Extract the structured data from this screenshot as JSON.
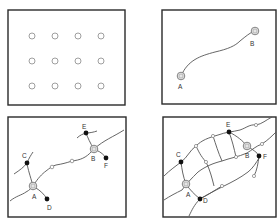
{
  "panels": [
    {
      "id": "grid-of-points",
      "description": "4x3 grid of hollow circles",
      "labels": []
    },
    {
      "id": "single-link",
      "description": "Curve connecting two hubs",
      "labels": {
        "a": "A",
        "b": "B"
      }
    },
    {
      "id": "hubs-with-spurs",
      "description": "Main route A-B with branches to C, D, E, F",
      "labels": {
        "a": "A",
        "b": "B",
        "c": "C",
        "d": "D",
        "e": "E",
        "f": "F"
      }
    },
    {
      "id": "full-network",
      "description": "Dense network connecting A-F with cross links",
      "labels": {
        "a": "A",
        "b": "B",
        "c": "C",
        "d": "D",
        "e": "E",
        "f": "F"
      }
    }
  ],
  "colors": {
    "frame": "#2a2a2a",
    "line": "#555555",
    "solid_node": "#111111",
    "hollow_node": "#888888"
  }
}
